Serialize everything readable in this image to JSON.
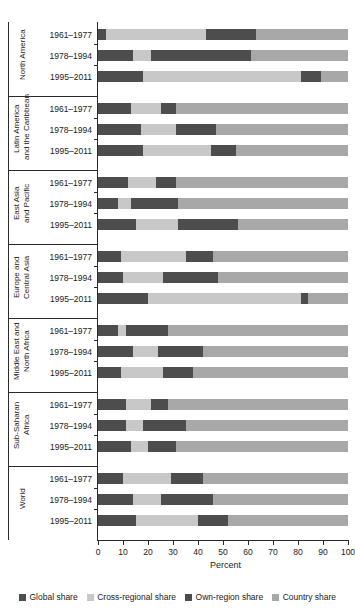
{
  "chart_data": {
    "type": "bar",
    "orientation": "horizontal",
    "stacked": true,
    "stack_mode": "percent",
    "title": "",
    "xlabel": "Percent",
    "ylabel": "",
    "xlim": [
      0,
      100
    ],
    "xticks": [
      0,
      10,
      20,
      30,
      40,
      50,
      60,
      70,
      80,
      90,
      100
    ],
    "xticklabels": [
      "0",
      "10",
      "20",
      "30",
      "40",
      "50",
      "60",
      "70",
      "80",
      "90",
      "100"
    ],
    "grid": false,
    "legend_position": "bottom",
    "series": [
      {
        "name": "Global share",
        "color": "#4d4d4d"
      },
      {
        "name": "Cross-regional share",
        "color": "#c8c8c8"
      },
      {
        "name": "Own-region share",
        "color": "#4d4d4d"
      },
      {
        "name": "Country share",
        "color": "#a8a8a8"
      }
    ],
    "categories": [
      "1961-1977",
      "1978-1994",
      "1995-2011"
    ],
    "groups": [
      {
        "region": "North America",
        "region_lines": [
          "North America"
        ],
        "rows": [
          {
            "period": "1961–1977",
            "values": [
              3,
              40,
              20,
              37
            ]
          },
          {
            "period": "1978–1994",
            "values": [
              14,
              7,
              40,
              39
            ]
          },
          {
            "period": "1995–2011",
            "values": [
              18,
              63,
              8,
              11
            ]
          }
        ]
      },
      {
        "region": "Latin America and the Caribbean",
        "region_lines": [
          "Latin America",
          "and the Caribbean"
        ],
        "rows": [
          {
            "period": "1961–1977",
            "values": [
              13,
              12,
              6,
              69
            ]
          },
          {
            "period": "1978–1994",
            "values": [
              17,
              14,
              16,
              53
            ]
          },
          {
            "period": "1995–2011",
            "values": [
              18,
              27,
              10,
              45
            ]
          }
        ]
      },
      {
        "region": "East Asia and Pacific",
        "region_lines": [
          "East Asia",
          "and Pacific"
        ],
        "rows": [
          {
            "period": "1961–1977",
            "values": [
              12,
              11,
              8,
              69
            ]
          },
          {
            "period": "1978–1994",
            "values": [
              8,
              5,
              19,
              68
            ]
          },
          {
            "period": "1995–2011",
            "values": [
              15,
              17,
              24,
              44
            ]
          }
        ]
      },
      {
        "region": "Europe and Central Asia",
        "region_lines": [
          "Europe and",
          "Central Asia"
        ],
        "rows": [
          {
            "period": "1961–1977",
            "values": [
              9,
              26,
              11,
              54
            ]
          },
          {
            "period": "1978–1994",
            "values": [
              10,
              16,
              22,
              52
            ]
          },
          {
            "period": "1995–2011",
            "values": [
              20,
              61,
              3,
              16
            ]
          }
        ]
      },
      {
        "region": "Middle East and North Africa",
        "region_lines": [
          "Middle East and",
          "North Africa"
        ],
        "rows": [
          {
            "period": "1961–1977",
            "values": [
              8,
              3,
              17,
              72
            ]
          },
          {
            "period": "1978–1994",
            "values": [
              14,
              10,
              18,
              58
            ]
          },
          {
            "period": "1995–2011",
            "values": [
              9,
              17,
              12,
              62
            ]
          }
        ]
      },
      {
        "region": "Sub-Saharan Africa",
        "region_lines": [
          "Sub-Saharan",
          "Africa"
        ],
        "rows": [
          {
            "period": "1961–1977",
            "values": [
              11,
              10,
              7,
              72
            ]
          },
          {
            "period": "1978–1994",
            "values": [
              11,
              7,
              17,
              65
            ]
          },
          {
            "period": "1995–2011",
            "values": [
              13,
              7,
              11,
              69
            ]
          }
        ]
      },
      {
        "region": "World",
        "region_lines": [
          "World"
        ],
        "rows": [
          {
            "period": "1961–1977",
            "values": [
              10,
              19,
              13,
              58
            ]
          },
          {
            "period": "1978–1994",
            "values": [
              14,
              11,
              21,
              54
            ]
          },
          {
            "period": "1995–2011",
            "values": [
              15,
              25,
              12,
              48
            ]
          }
        ]
      }
    ]
  },
  "legend": {
    "items": [
      {
        "label": "Global share",
        "color": "#4d4d4d"
      },
      {
        "label": "Cross-regional share",
        "color": "#c8c8c8"
      },
      {
        "label": "Own-region share",
        "color": "#4d4d4d"
      },
      {
        "label": "Country share",
        "color": "#a8a8a8"
      }
    ]
  },
  "axis": {
    "x_title": "Percent"
  }
}
